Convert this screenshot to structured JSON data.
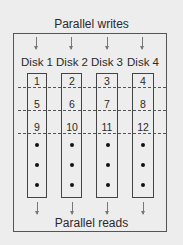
{
  "diagram": {
    "top_label": "Parallel writes",
    "bottom_label": "Parallel reads",
    "disks": [
      {
        "label": "Disk 1",
        "blocks": [
          "1",
          "5",
          "9"
        ]
      },
      {
        "label": "Disk 2",
        "blocks": [
          "2",
          "6",
          "10"
        ]
      },
      {
        "label": "Disk 3",
        "blocks": [
          "3",
          "7",
          "11"
        ]
      },
      {
        "label": "Disk 4",
        "blocks": [
          "4",
          "8",
          "12"
        ]
      }
    ],
    "continuation": "•••",
    "colors": {
      "background": "#ededed",
      "line": "#444444",
      "text": "#2a2a2a"
    }
  }
}
